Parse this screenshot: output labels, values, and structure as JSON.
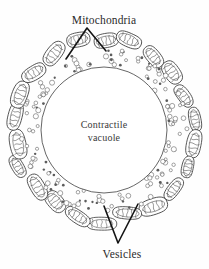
{
  "figure": {
    "type": "biological-diagram",
    "background_color": "#fefefe",
    "ink_color": "#2b2b2b"
  },
  "labels": {
    "top": {
      "text": "Mitochondria",
      "x": 104,
      "y": 24,
      "anchor": "middle"
    },
    "bottom": {
      "text": "Vesicles",
      "x": 122,
      "y": 258,
      "anchor": "middle"
    },
    "center_line1": {
      "text": "Contractile",
      "x": 104,
      "y": 128
    },
    "center_line2": {
      "text": "vacuole",
      "x": 104,
      "y": 141
    }
  },
  "leaders": {
    "mitochondria": {
      "apex": [
        87,
        28
      ],
      "arm_left_end": [
        66,
        59
      ],
      "arm_right_end": [
        106,
        51
      ]
    },
    "vesicles": {
      "apex": [
        118,
        243
      ],
      "arm_left_end": [
        104,
        206
      ],
      "arm_right_end": [
        138,
        204
      ]
    }
  },
  "vacuole": {
    "center": [
      104,
      130
    ],
    "radius": 63,
    "stroke": "#4a4a4a",
    "fill": "#ffffff"
  },
  "vesicle_band": {
    "inner_radius": 64,
    "outer_radius": 83,
    "count": 150,
    "circle_radius_range": [
      1.1,
      2.6
    ],
    "stroke": "#575757"
  },
  "mitochondria_ring": {
    "count": 22,
    "orbit_radius": 90,
    "body_rx_range": [
      11,
      15
    ],
    "body_ry_range": [
      6,
      8
    ],
    "stroke": "#3d3d3d",
    "crista_stroke": "#4f4f4f",
    "cristae_per_body": 5
  },
  "chart_data": {
    "type": "diagram",
    "components": [
      {
        "name": "Contractile vacuole",
        "label": "Contractile vacuole",
        "shape": "circle",
        "position": "center",
        "count": 1
      },
      {
        "name": "Vesicles",
        "label": "Vesicles",
        "shape": "small-circles",
        "position": "annulus around vacuole",
        "count": 150
      },
      {
        "name": "Mitochondria",
        "label": "Mitochondria",
        "shape": "oval-with-cristae",
        "position": "outer ring",
        "count": 22
      }
    ]
  }
}
